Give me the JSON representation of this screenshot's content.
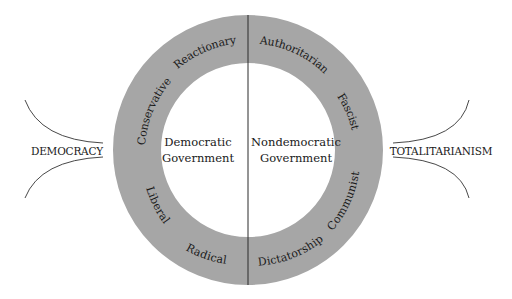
{
  "diagram": {
    "colors": {
      "ring": "#a6a6a6",
      "line": "#2a2a2a",
      "background": "#ffffff"
    },
    "center": {
      "left": [
        "Democratic",
        "Government"
      ],
      "right": [
        "Nondemocratic",
        "Government"
      ]
    },
    "ring_labels": {
      "reactionary": "Reactionary",
      "conservative": "Conservative",
      "liberal": "Liberal",
      "radical": "Radical",
      "authoritarian": "Authoritarian",
      "fascist": "Fascist",
      "communist": "Communist",
      "dictatorship": "Dictatorship"
    },
    "poles": {
      "left": "DEMOCRACY",
      "right": "TOTALITARIANISM"
    }
  }
}
